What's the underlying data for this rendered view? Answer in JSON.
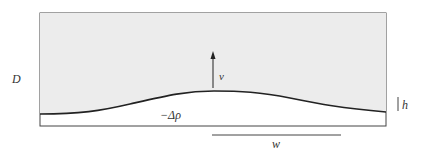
{
  "labels": {
    "depth": "D",
    "velocity": "v",
    "density": "−Δρ",
    "height": "h",
    "width": "w"
  },
  "colors": {
    "fluid": "#ececec",
    "stroke": "#222222"
  }
}
